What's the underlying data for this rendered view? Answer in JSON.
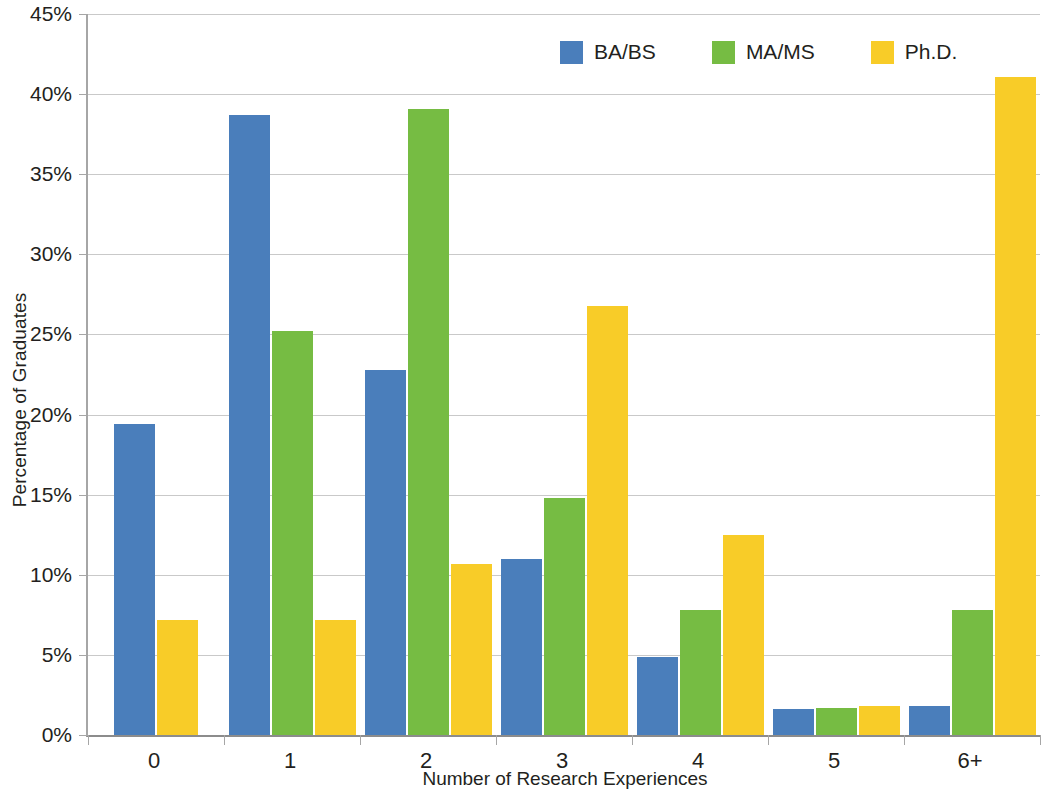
{
  "chart_data": {
    "type": "bar",
    "title": "",
    "subtitle": "",
    "xlabel": "Number of Research Experiences",
    "ylabel": "Percentage of Graduates",
    "categories": [
      "0",
      "1",
      "2",
      "3",
      "4",
      "5",
      "6+"
    ],
    "series": [
      {
        "name": "BA/BS",
        "color": "#4a7ebb",
        "values": [
          19.4,
          38.7,
          22.8,
          11.0,
          4.9,
          1.6,
          1.8
        ]
      },
      {
        "name": "MA/MS",
        "color": "#76bc43",
        "values": [
          0,
          25.2,
          39.1,
          14.8,
          7.8,
          1.7,
          7.8
        ]
      },
      {
        "name": "Ph.D.",
        "color": "#f8cc28",
        "values": [
          7.2,
          7.2,
          10.7,
          26.8,
          12.5,
          1.8,
          41.1
        ]
      }
    ],
    "ylim": [
      0,
      45
    ],
    "ytick_values": [
      0,
      5,
      10,
      15,
      20,
      25,
      30,
      35,
      40,
      45
    ],
    "ytick_labels": [
      "0%",
      "5%",
      "10%",
      "15%",
      "20%",
      "25%",
      "30%",
      "35%",
      "40%",
      "45%"
    ],
    "grid": true,
    "legend_position": "top-right",
    "value_suffix": "%"
  }
}
